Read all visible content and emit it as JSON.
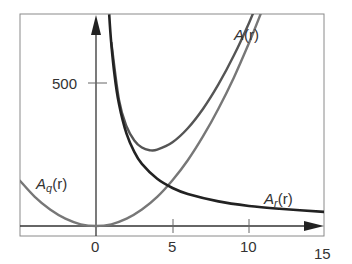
{
  "chart_data": {
    "type": "line",
    "title": "",
    "xlabel": "",
    "ylabel": "",
    "xlim": [
      -5,
      15
    ],
    "ylim": [
      -35,
      742
    ],
    "x_ticks": [
      0,
      5,
      10,
      15
    ],
    "x_tick_labels": [
      "0",
      "5",
      "10",
      "15"
    ],
    "y_ticks": [
      500
    ],
    "y_tick_labels": [
      "500"
    ],
    "grid": false,
    "legend": "inline labels",
    "series": [
      {
        "name": "A(r)",
        "label": "A(r)",
        "color": "#555555",
        "x": [
          1.0,
          1.5,
          2.0,
          2.5,
          3.0,
          3.5,
          4.0,
          5.0,
          6.0,
          7.0,
          8.0,
          9.0,
          10.0,
          10.5
        ],
        "values": [
          643,
          441,
          348,
          299,
          274,
          265,
          267,
          293,
          342,
          410,
          495,
          595,
          710,
          775
        ]
      },
      {
        "name": "A_q(r)",
        "label": "A_q(r)",
        "color": "#777777",
        "x": [
          -5,
          -4,
          -3,
          -2,
          -1,
          0,
          1,
          2,
          3,
          4,
          5,
          6,
          7,
          8,
          9,
          10,
          10.8
        ],
        "values": [
          160,
          102,
          58,
          26,
          6,
          0,
          6,
          26,
          58,
          102,
          160,
          230,
          314,
          410,
          518,
          640,
          746
        ]
      },
      {
        "name": "A_r(r)",
        "label": "A_r(r)",
        "color": "#222222",
        "x": [
          0.86,
          1.0,
          1.2,
          1.5,
          2.0,
          2.5,
          3.0,
          4.0,
          5.0,
          6.0,
          8.0,
          10.0,
          12.0,
          15.0
        ],
        "values": [
          740,
          637,
          532,
          427,
          322,
          259,
          217,
          165,
          133,
          112,
          86,
          70,
          60,
          49
        ]
      }
    ],
    "annotations": [
      {
        "text": "A(r)",
        "x": 8.6,
        "y": 680
      },
      {
        "text": "A_q(r)",
        "x": -4.2,
        "y": 190
      },
      {
        "text": "A_r(r)",
        "x": 10.9,
        "y": 90
      }
    ]
  },
  "axes": {
    "y_tick_500": "500",
    "x_tick_0": "0",
    "x_tick_5": "5",
    "x_tick_10": "10",
    "x_tick_15": "15"
  },
  "labels": {
    "a_main": "A",
    "a_q_sub": "q",
    "a_r_sub": "r",
    "arg": "(r)"
  }
}
